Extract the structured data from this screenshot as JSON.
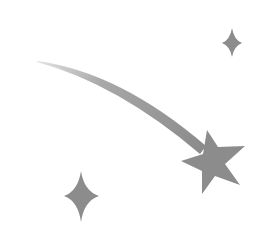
{
  "image": {
    "description": "Shooting star illustration with two sparkles",
    "background": "#ffffff",
    "colors": {
      "fill": "#8c8c8c",
      "trail_start": "#d8d8d8",
      "trail_end": "#8a8a8a"
    },
    "icons": [
      {
        "name": "shooting-star-icon"
      },
      {
        "name": "sparkle-small-icon"
      },
      {
        "name": "sparkle-large-icon"
      }
    ]
  }
}
